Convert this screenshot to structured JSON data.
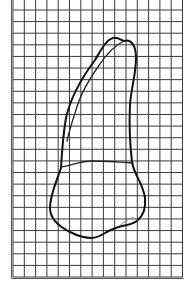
{
  "figure": {
    "grid": {
      "left": 13,
      "right": 182.5,
      "top_first_line": 10,
      "bottom": 277,
      "columns": 15,
      "rows": 23,
      "line_color": "#3a3a3a",
      "background": "#ffffff"
    },
    "outline_color": "#111111",
    "labels": []
  }
}
